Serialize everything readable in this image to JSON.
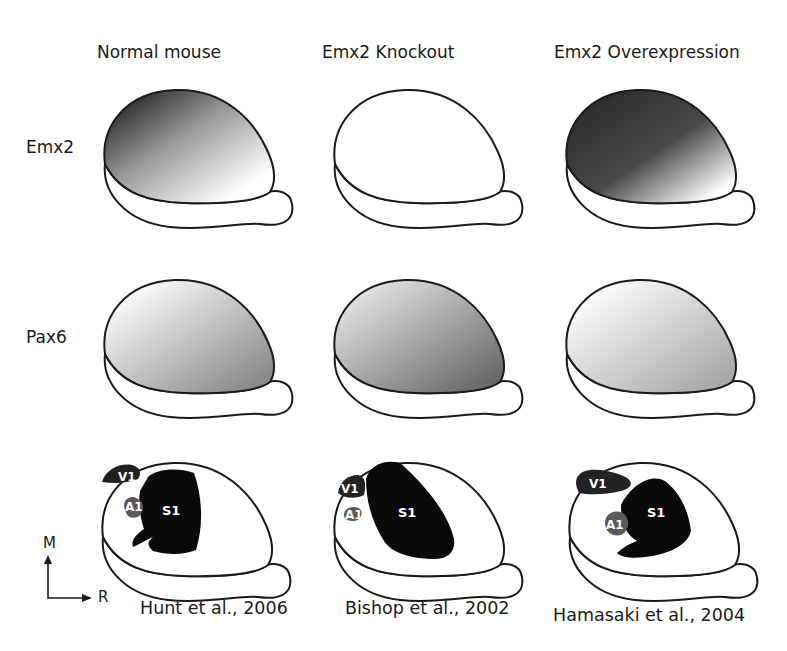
{
  "columns": [
    {
      "title": "Normal mouse",
      "citation": "Hunt et al., 2006"
    },
    {
      "title": "Emx2 Knockout",
      "citation": "Bishop et al., 2002"
    },
    {
      "title": "Emx2 Overexpression",
      "citation": "Hamasaki et al., 2004"
    }
  ],
  "rows": [
    {
      "label": "Emx2"
    },
    {
      "label": "Pax6"
    },
    {
      "label": ""
    }
  ],
  "areas": {
    "v1": "V1",
    "a1": "A1",
    "s1": "S1"
  },
  "axis": {
    "vertical": "M",
    "horizontal": "R"
  },
  "colors": {
    "outline": "#1a1a1a",
    "s1": "#0a0a0a",
    "v1": "#222222",
    "a1": "#5a5a5a"
  }
}
